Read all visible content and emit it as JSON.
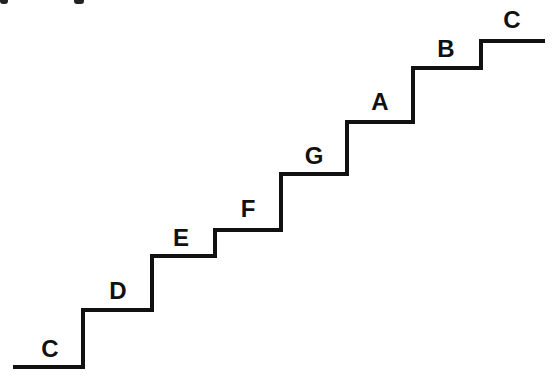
{
  "diagram": {
    "type": "staircase-scale",
    "stroke_color": "#111111",
    "background": "#ffffff",
    "steps": [
      {
        "note": "C",
        "x1": 13,
        "x2": 83,
        "y": 367,
        "label_x": 50,
        "label_y": 337
      },
      {
        "note": "D",
        "x1": 83,
        "x2": 152,
        "y": 310,
        "label_x": 118,
        "label_y": 279
      },
      {
        "note": "E",
        "x1": 152,
        "x2": 215,
        "y": 256,
        "label_x": 181,
        "label_y": 226
      },
      {
        "note": "F",
        "x1": 215,
        "x2": 281,
        "y": 230,
        "label_x": 248,
        "label_y": 197
      },
      {
        "note": "G",
        "x1": 281,
        "x2": 347,
        "y": 174,
        "label_x": 314,
        "label_y": 144
      },
      {
        "note": "A",
        "x1": 347,
        "x2": 413,
        "y": 122,
        "label_x": 380,
        "label_y": 90
      },
      {
        "note": "B",
        "x1": 413,
        "x2": 481,
        "y": 68,
        "label_x": 446,
        "label_y": 37
      },
      {
        "note": "C",
        "x1": 481,
        "x2": 545,
        "y": 41,
        "label_x": 512,
        "label_y": 8
      }
    ]
  }
}
